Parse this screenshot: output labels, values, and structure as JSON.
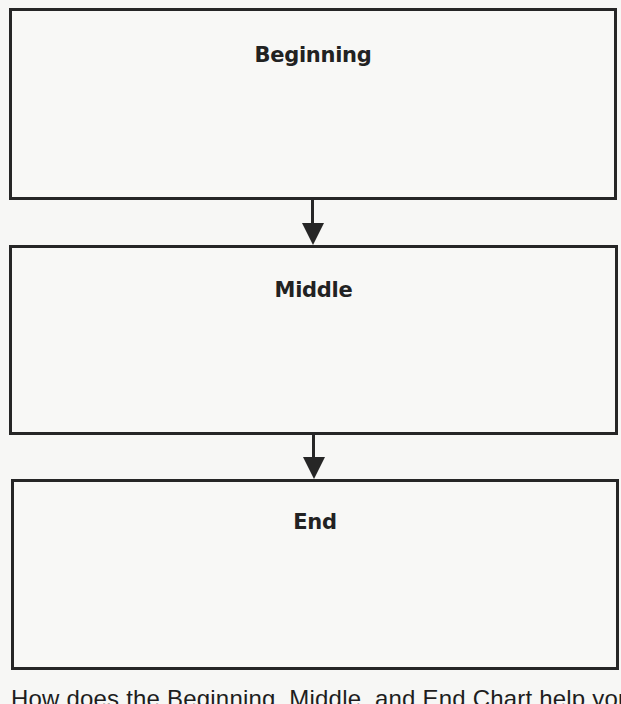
{
  "diagram": {
    "type": "flowchart",
    "direction": "top-to-bottom",
    "boxes": [
      {
        "id": "beginning",
        "label": "Beginning"
      },
      {
        "id": "middle",
        "label": "Middle"
      },
      {
        "id": "end",
        "label": "End"
      }
    ],
    "arrows": [
      {
        "from": "beginning",
        "to": "middle"
      },
      {
        "from": "middle",
        "to": "end"
      }
    ]
  },
  "question": {
    "text": "How does the Beginning, Middle, and End Chart help you"
  },
  "colors": {
    "stroke": "#262626",
    "background": "#f7f7f5",
    "text": "#222222"
  }
}
